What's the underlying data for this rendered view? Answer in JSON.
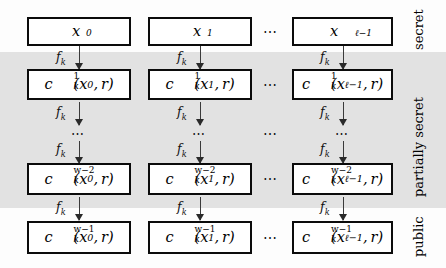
{
  "figure": {
    "band_label_visible": true
  },
  "columns": [
    {
      "index": 0,
      "arg": "x",
      "arg_sub": "0"
    },
    {
      "index": 1,
      "arg": "x",
      "arg_sub": "1"
    },
    {
      "index": 2,
      "arg": "x",
      "arg_sub": "ℓ−1"
    }
  ],
  "column_gap_ellipsis": "⋯",
  "rows": [
    {
      "id": "row-top",
      "kind": "input",
      "cells": [
        {
          "base": "x",
          "sub": "0",
          "sup": ""
        },
        {
          "base": "x",
          "sub": "1",
          "sup": ""
        },
        {
          "base": "x",
          "sub": "ℓ−1",
          "sup": ""
        }
      ]
    },
    {
      "id": "row-c1",
      "kind": "formula",
      "cells": [
        {
          "base": "c",
          "sub": "k",
          "sup": "1",
          "args": "(x₀, r)"
        },
        {
          "base": "c",
          "sub": "k",
          "sup": "1",
          "args": "(x₁, r)"
        },
        {
          "base": "c",
          "sub": "k",
          "sup": "1",
          "args": "(xℓ₋₁, r)"
        }
      ]
    },
    {
      "id": "row-dots",
      "kind": "ellipsis",
      "cells": [
        {
          "text": "⋯"
        },
        {
          "text": "⋯"
        },
        {
          "text": "⋯"
        }
      ]
    },
    {
      "id": "row-cw2",
      "kind": "formula",
      "cells": [
        {
          "base": "c",
          "sub": "k",
          "sup": "w−2",
          "args": "(x₀, r)"
        },
        {
          "base": "c",
          "sub": "k",
          "sup": "w−2",
          "args": "(x₁, r)"
        },
        {
          "base": "c",
          "sub": "k",
          "sup": "w−2",
          "args": "(xℓ₋₁, r)"
        }
      ]
    },
    {
      "id": "row-cw1",
      "kind": "formula",
      "cells": [
        {
          "base": "c",
          "sub": "k",
          "sup": "w−1",
          "args": "(x₀, r)"
        },
        {
          "base": "c",
          "sub": "k",
          "sup": "w−1",
          "args": "(x₁, r)"
        },
        {
          "base": "c",
          "sub": "k",
          "sup": "w−1",
          "args": "(xℓ₋₁, r)"
        }
      ]
    }
  ],
  "arrow": {
    "label_base": "f",
    "label_sub": "k",
    "label_full": "fₖ"
  },
  "side_labels": [
    {
      "id": "label-secret",
      "text": "secret"
    },
    {
      "id": "label-partially-secret",
      "text": "partially secret"
    },
    {
      "id": "label-public",
      "text": "public"
    }
  ],
  "colors": {
    "band": "#e2e2e2",
    "box_border": "#0b0b0b",
    "box_fill": "#ffffff",
    "text": "#000000",
    "arrow": "#3a3a3a",
    "page_background": "#fdfdfd"
  }
}
